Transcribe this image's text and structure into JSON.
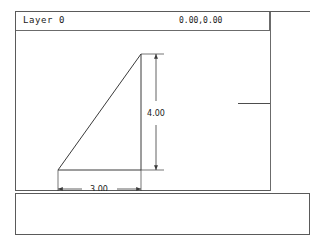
{
  "window": {
    "title_bar": {
      "layer_label": "Layer 0",
      "coordinates": "0.00,0.00"
    }
  },
  "drawing": {
    "name": "right-triangle",
    "shape": {
      "type": "triangle",
      "vertices": [
        {
          "x": 42,
          "y": 139
        },
        {
          "x": 125,
          "y": 23
        },
        {
          "x": 125,
          "y": 139
        }
      ]
    },
    "dimensions": [
      {
        "name": "horizontal-dimension",
        "label": "3.00",
        "orientation": "horizontal",
        "value": 3.0,
        "from": {
          "x": 42,
          "y": 158
        },
        "to": {
          "x": 125,
          "y": 158
        }
      },
      {
        "name": "vertical-dimension",
        "label": "4.00",
        "orientation": "vertical",
        "value": 4.0,
        "from": {
          "x": 140,
          "y": 23
        },
        "to": {
          "x": 140,
          "y": 139
        }
      }
    ]
  },
  "colors": {
    "frame": "#5a5a5a",
    "geometry": "#3a3a3a",
    "dimension": "#3a3a3a",
    "text": "#1a1a1a",
    "background": "#ffffff"
  }
}
